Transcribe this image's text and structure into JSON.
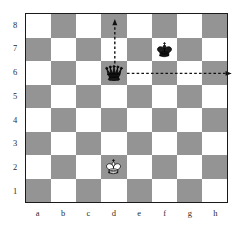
{
  "diagram": {
    "type": "chess-board",
    "orientation": "white-bottom",
    "board_size": 8,
    "colors": {
      "light_square": "#ffffff",
      "dark_square": "#949494",
      "border": "#1a1a1a",
      "label": "#2b2b2b",
      "arrow": "#111111"
    },
    "rank_labels": [
      "8",
      "7",
      "6",
      "5",
      "4",
      "3",
      "2",
      "1"
    ],
    "file_labels": [
      "a",
      "b",
      "c",
      "d",
      "e",
      "f",
      "g",
      "h"
    ],
    "pieces": [
      {
        "piece": "black-queen",
        "color": "black",
        "type": "queen",
        "square": "d6",
        "file": "d",
        "rank": "6",
        "glyph": "black-queen-icon"
      },
      {
        "piece": "black-king",
        "color": "black",
        "type": "king",
        "square": "f7",
        "file": "f",
        "rank": "7",
        "glyph": "black-king-icon"
      },
      {
        "piece": "white-king",
        "color": "white",
        "type": "king",
        "square": "d2",
        "file": "d",
        "rank": "2",
        "glyph": "white-king-icon"
      }
    ],
    "arrows": [
      {
        "name": "queen-move-up",
        "from": "d6",
        "to": "d8",
        "direction": "up",
        "style": "dashed",
        "head": "single"
      },
      {
        "name": "queen-move-right",
        "from": "d6",
        "to": "h6",
        "direction": "right",
        "style": "dashed",
        "head": "single"
      }
    ]
  }
}
